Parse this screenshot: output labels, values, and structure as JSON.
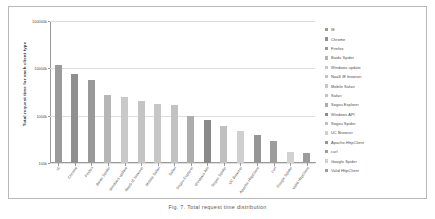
{
  "chart_data": {
    "type": "bar",
    "title": "",
    "xlabel": "",
    "ylabel": "Total request time for each client type",
    "yscale": "log",
    "ylim": [
      100,
      100000
    ],
    "ytick_labels": [
      "100000k",
      "10000k",
      "1000k",
      "100k"
    ],
    "ytick_values": [
      100000,
      10000,
      1000,
      100
    ],
    "grid": true,
    "legend_position": "right",
    "categories": [
      "IE",
      "Chrome",
      "Firefox",
      "Baidu Spider",
      "Windows update",
      "NaaS IE browser",
      "Mobile Safari",
      "Safari",
      "Sogou Explorer",
      "Windows API",
      "Sogou Spider",
      "UC Browser",
      "Apache-HttpClient",
      "curl",
      "Google Spider",
      "Valid HttpClient"
    ],
    "values": [
      12000,
      7600,
      5700,
      2700,
      2450,
      2050,
      1750,
      1700,
      1000,
      830,
      610,
      470,
      390,
      290,
      175,
      165
    ],
    "colors": [
      "#9a9a9a",
      "#8f8f8f",
      "#999999",
      "#b6b6b6",
      "#c9c9c9",
      "#c4c4c4",
      "#c7c7c7",
      "#c2c2c2",
      "#adadad",
      "#8a8a8a",
      "#c0c0c0",
      "#cfcfcf",
      "#959595",
      "#9d9d9d",
      "#d2d2d2",
      "#9c9c9c"
    ]
  },
  "legend": {
    "items": [
      {
        "label": "IE",
        "color": "#9a9a9a"
      },
      {
        "label": "Chrome",
        "color": "#8f8f8f"
      },
      {
        "label": "Firefox",
        "color": "#999999"
      },
      {
        "label": "Baidu Spider",
        "color": "#b6b6b6"
      },
      {
        "label": "Windows update",
        "color": "#c9c9c9"
      },
      {
        "label": "NaaS IE browser",
        "color": "#c4c4c4"
      },
      {
        "label": "Mobile Safari",
        "color": "#c7c7c7"
      },
      {
        "label": "Safari",
        "color": "#c2c2c2"
      },
      {
        "label": "Sogou Explorer",
        "color": "#adadad"
      },
      {
        "label": "Windows API",
        "color": "#8a8a8a"
      },
      {
        "label": "Sogou Spider",
        "color": "#c0c0c0"
      },
      {
        "label": "UC Browser",
        "color": "#cfcfcf"
      },
      {
        "label": "Apache-HttpClient",
        "color": "#959595"
      },
      {
        "label": "curl",
        "color": "#9d9d9d"
      },
      {
        "label": "Google Spider",
        "color": "#d2d2d2"
      },
      {
        "label": "Valid HttpClient",
        "color": "#9c9c9c"
      }
    ]
  },
  "caption": {
    "text": "Fig. 7. Total request time distribution"
  }
}
